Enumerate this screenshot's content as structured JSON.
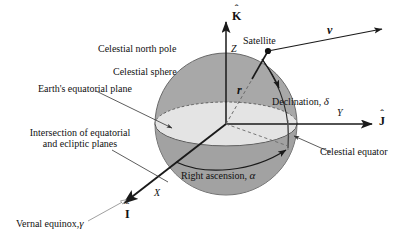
{
  "figure": {
    "background": "#ffffff",
    "sphere_fill": "#a8a8a8",
    "plane_fill": "#e2e2e2",
    "line_color": "#1a1a1a",
    "leader_color": "#444444"
  },
  "labels": {
    "celestial_north_pole": "Celestial north pole",
    "celestial_sphere": "Celestial sphere",
    "earths_equatorial_plane": "Earth's equatorial plane",
    "intersection_line1": "Intersection of equatorial",
    "intersection_line2": "and ecliptic planes",
    "vernal_equinox": "Vernal equinox,",
    "vernal_equinox_symbol": "γ",
    "satellite": "Satellite",
    "declination": "Declination,",
    "declination_symbol": "δ",
    "right_ascension": "Right ascension,",
    "right_ascension_symbol": "α",
    "celestial_equator": "Celestial equator"
  },
  "axes": {
    "k_hat": "K",
    "k_hat_accent": "ˆ",
    "z_letter": "Z",
    "j_hat": "J",
    "j_hat_accent": "ˆ",
    "y_letter": "Y",
    "i_hat": "I",
    "i_hat_accent": "ˆ",
    "x_letter": "X"
  },
  "vectors": {
    "position": "r",
    "velocity": "v"
  },
  "geometry": {
    "sphere_center_x": 226,
    "sphere_center_y": 124,
    "sphere_radius": 71,
    "satellite_x": 268,
    "satellite_y": 51
  }
}
